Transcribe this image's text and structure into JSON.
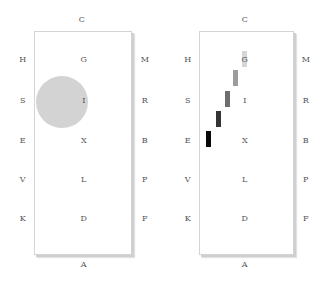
{
  "figure": {
    "left_panel": {
      "top_label": "C",
      "bottom_label": "A",
      "left_labels": [
        "H",
        "S",
        "E",
        "V",
        "K"
      ],
      "center_labels": [
        "G",
        "I",
        "X",
        "L",
        "D"
      ],
      "right_labels": [
        "M",
        "R",
        "B",
        "P",
        "F"
      ],
      "marker": {
        "type": "circle",
        "color": "#d3d3d3",
        "position_near": "I"
      }
    },
    "right_panel": {
      "top_label": "C",
      "bottom_label": "A",
      "left_labels": [
        "H",
        "S",
        "E",
        "V",
        "K"
      ],
      "center_labels": [
        "G",
        "I",
        "X",
        "L",
        "D"
      ],
      "right_labels": [
        "M",
        "R",
        "B",
        "P",
        "F"
      ],
      "marker": {
        "type": "bar-trail",
        "bars": [
          {
            "color": "#0a0a0a"
          },
          {
            "color": "#3a3a3a"
          },
          {
            "color": "#6e6e6e"
          },
          {
            "color": "#9a9a9a"
          },
          {
            "color": "#d0d0d0"
          }
        ]
      }
    }
  }
}
